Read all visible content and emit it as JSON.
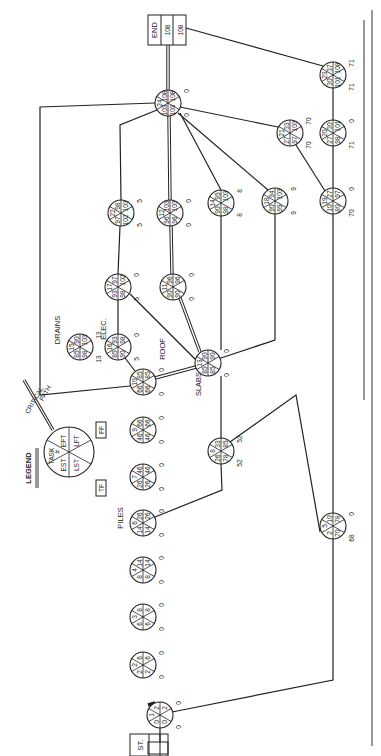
{
  "legend": {
    "title": "LEGEND",
    "fields": [
      "TASK #",
      "EST",
      "EFT",
      "LST",
      "LFT"
    ],
    "tf": "TF",
    "ff": "FF",
    "critical_path_label": "CRITICAL PATH"
  },
  "start_label": "ST.",
  "end_label": "END",
  "end_values": [
    "108",
    "108"
  ],
  "activity_labels": {
    "piles": "PILES",
    "roof": "ROOF",
    "slabs": "SLABS",
    "drains": "DRAINS",
    "elec": "ELEC."
  },
  "nodes": [
    {
      "id": 1,
      "x": 160,
      "y": 715,
      "est": 0,
      "eft": 2,
      "lst": 0,
      "lft": 2,
      "tf": 0,
      "ff": 0
    },
    {
      "id": 2,
      "x": 143,
      "y": 665,
      "est": 2,
      "eft": 6,
      "lst": 2,
      "lft": 6,
      "tf": 0,
      "ff": 0
    },
    {
      "id": 3,
      "x": 143,
      "y": 617,
      "est": 6,
      "eft": 8,
      "lst": 6,
      "lft": 8,
      "tf": 0,
      "ff": 0
    },
    {
      "id": 4,
      "x": 143,
      "y": 570,
      "est": 8,
      "eft": 14,
      "lst": 8,
      "lft": 14,
      "tf": 0,
      "ff": 0
    },
    {
      "id": 6,
      "x": 143,
      "y": 523,
      "est": 14,
      "eft": 26,
      "lst": 14,
      "lft": 26,
      "tf": 0,
      "ff": 0
    },
    {
      "id": 7,
      "x": 143,
      "y": 477,
      "est": 26,
      "eft": 46,
      "lst": 26,
      "lft": 46,
      "tf": 0,
      "ff": 0
    },
    {
      "id": 9,
      "x": 143,
      "y": 430,
      "est": 46,
      "eft": 66,
      "lst": 46,
      "lft": 66,
      "tf": 0,
      "ff": 0
    },
    {
      "id": 10,
      "x": 143,
      "y": 382,
      "est": 66,
      "eft": 85,
      "lst": 66,
      "lft": 85,
      "tf": 0,
      "ff": 0
    },
    {
      "id": 8,
      "x": 221,
      "y": 451,
      "est": 26,
      "eft": 33,
      "lst": 78,
      "lft": 85,
      "tf": 52,
      "ff": 52
    },
    {
      "id": 5,
      "x": 333,
      "y": 526,
      "est": 2,
      "eft": 10,
      "lst": 70,
      "lft": 78,
      "tf": 68,
      "ff": 0
    },
    {
      "id": 13,
      "x": 208,
      "y": 363,
      "est": 85,
      "eft": 90,
      "lst": 85,
      "lft": 90,
      "tf": 0,
      "ff": 0
    },
    {
      "id": 15,
      "x": 80,
      "y": 347,
      "est": 85,
      "eft": 90,
      "lst": 98,
      "lft": 103,
      "tf": 13,
      "ff": 13
    },
    {
      "id": 16,
      "x": 118,
      "y": 347,
      "est": 85,
      "eft": 93,
      "lst": 90,
      "lft": 98,
      "tf": 5,
      "ff": 0
    },
    {
      "id": 17,
      "x": 118,
      "y": 287,
      "est": 93,
      "eft": 97,
      "lst": 98,
      "lft": 102,
      "tf": 5,
      "ff": 0
    },
    {
      "id": 11,
      "x": 173,
      "y": 287,
      "est": 90,
      "eft": 96,
      "lst": 90,
      "lft": 96,
      "tf": 0,
      "ff": 0
    },
    {
      "id": 22,
      "x": 121,
      "y": 213,
      "est": 97,
      "eft": 98,
      "lst": 102,
      "lft": 103,
      "tf": 5,
      "ff": 5
    },
    {
      "id": 12,
      "x": 170,
      "y": 213,
      "est": 96,
      "eft": 103,
      "lst": 96,
      "lft": 103,
      "tf": 0,
      "ff": 0
    },
    {
      "id": 14,
      "x": 221,
      "y": 203,
      "est": 90,
      "eft": 95,
      "lst": 98,
      "lft": 103,
      "tf": 8,
      "ff": 8
    },
    {
      "id": 18,
      "x": 275,
      "y": 201,
      "est": 90,
      "eft": 94,
      "lst": 99,
      "lft": 103,
      "tf": 9,
      "ff": 9
    },
    {
      "id": 24,
      "x": 168,
      "y": 103,
      "est": 103,
      "eft": 108,
      "lst": 103,
      "lft": 108,
      "tf": 0,
      "ff": 0
    },
    {
      "id": 21,
      "x": 290,
      "y": 133,
      "est": 27,
      "eft": 33,
      "lst": 97,
      "lft": 103,
      "tf": 70,
      "ff": 70
    },
    {
      "id": 19,
      "x": 333,
      "y": 201,
      "est": 10,
      "eft": 27,
      "lst": 80,
      "lft": 97,
      "tf": 70,
      "ff": 0
    },
    {
      "id": 20,
      "x": 333,
      "y": 133,
      "est": 27,
      "eft": 30,
      "lst": 98,
      "lft": 101,
      "tf": 71,
      "ff": 0
    },
    {
      "id": 23,
      "x": 333,
      "y": 75,
      "est": 30,
      "eft": 37,
      "lst": 101,
      "lft": 108,
      "tf": 71,
      "ff": 71
    }
  ]
}
